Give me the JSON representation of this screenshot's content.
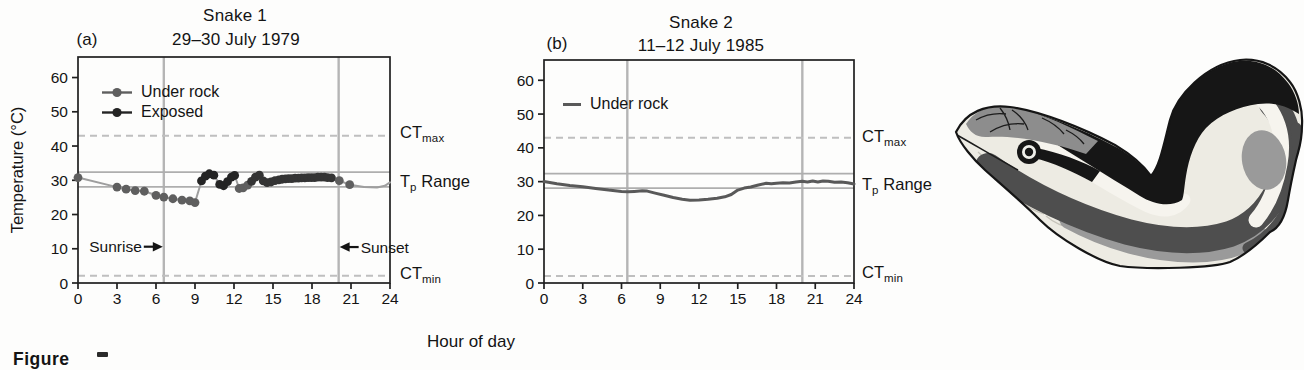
{
  "figure": {
    "panel_a_label": "(a)",
    "panel_b_label": "(b)",
    "y_axis_label": "Temperature (°C)",
    "x_axis_label": "Hour of day",
    "caption_fragment": "Figure",
    "labels": {
      "ct_prefix": "CT",
      "ct_max_sub": "max",
      "ct_min_sub": "min",
      "tp_t": "T",
      "tp_sub": "p",
      "tp_rest": " Range",
      "sunrise": "Sunrise",
      "sunset": "Sunset"
    },
    "legend_a": [
      {
        "label": "Under rock",
        "marker": "dot-line",
        "color_key": "under_rock"
      },
      {
        "label": "Exposed",
        "marker": "dot-line",
        "color_key": "exposed"
      }
    ],
    "legend_b": [
      {
        "label": "Under rock",
        "marker": "line",
        "color_key": "line_b"
      }
    ]
  },
  "colors": {
    "text": "#141414",
    "axis": "#1f1f1f",
    "under_rock": "#5f5f5f",
    "exposed": "#242424",
    "exposed_dark": "#343434",
    "connect_line": "#9e9e9e",
    "line_b": "#595959",
    "band_line": "#aeaeae",
    "dashed_line": "#bfbfbf",
    "event_line": "#b5b5b5"
  },
  "chart_data": [
    {
      "id": "a",
      "type": "scatter",
      "panel": "(a)",
      "title": [
        "Snake 1",
        "29–30 July 1979"
      ],
      "xlabel": "Hour of day",
      "ylabel": "Temperature (°C)",
      "xlim": [
        0,
        24
      ],
      "ylim": [
        0,
        66
      ],
      "x_ticks": [
        0,
        3,
        6,
        9,
        12,
        15,
        18,
        21,
        24
      ],
      "y_ticks": [
        0,
        10,
        20,
        30,
        40,
        50,
        60
      ],
      "ct_max": 43,
      "ct_min": 2.1,
      "tp_range": [
        28.1,
        32.4
      ],
      "sunrise_hour": 6.6,
      "sunset_hour": 20.05,
      "annotations": [
        {
          "label": "Sunrise",
          "x": 6.6,
          "y": 10.6,
          "side": "left"
        },
        {
          "label": "Sunset",
          "x": 20.05,
          "y": 10.5,
          "side": "right"
        }
      ],
      "point_series": [
        "under_rock",
        "exposed",
        "exposed_dark",
        "line_only"
      ],
      "line_points": [
        [
          0,
          30.8,
          0
        ],
        [
          3,
          28.0,
          0
        ],
        [
          3.7,
          27.4,
          0
        ],
        [
          4.4,
          27.0,
          0
        ],
        [
          5.1,
          26.8,
          0
        ],
        [
          6.0,
          25.6,
          0
        ],
        [
          6.6,
          25.1,
          0
        ],
        [
          7.3,
          24.6,
          0
        ],
        [
          8.0,
          24.2,
          0
        ],
        [
          8.6,
          24.0,
          0
        ],
        [
          9.0,
          23.5,
          0
        ],
        [
          9.5,
          29.8,
          1
        ],
        [
          9.8,
          31.2,
          1
        ],
        [
          10.1,
          31.9,
          1
        ],
        [
          10.45,
          31.5,
          1
        ],
        [
          10.9,
          28.8,
          1
        ],
        [
          11.2,
          28.4,
          1
        ],
        [
          11.5,
          29.6,
          1
        ],
        [
          11.8,
          30.9,
          1
        ],
        [
          12.05,
          31.4,
          1
        ],
        [
          12.4,
          27.6,
          0
        ],
        [
          12.7,
          27.8,
          0
        ],
        [
          13.05,
          28.6,
          0
        ],
        [
          13.35,
          29.7,
          2
        ],
        [
          13.65,
          30.9,
          2
        ],
        [
          13.95,
          31.5,
          2
        ],
        [
          14.25,
          29.8,
          2
        ],
        [
          14.55,
          29.3,
          2
        ],
        [
          14.85,
          29.5,
          2
        ],
        [
          15.15,
          29.9,
          2
        ],
        [
          15.45,
          30.1,
          2
        ],
        [
          15.7,
          30.3,
          2
        ],
        [
          15.95,
          30.4,
          2
        ],
        [
          16.2,
          30.5,
          2
        ],
        [
          16.45,
          30.5,
          2
        ],
        [
          16.7,
          30.6,
          2
        ],
        [
          16.95,
          30.6,
          2
        ],
        [
          17.2,
          30.7,
          2
        ],
        [
          17.45,
          30.7,
          2
        ],
        [
          17.7,
          30.8,
          2
        ],
        [
          17.95,
          30.8,
          2
        ],
        [
          18.2,
          30.8,
          2
        ],
        [
          18.45,
          30.9,
          2
        ],
        [
          18.7,
          30.9,
          2
        ],
        [
          18.95,
          30.9,
          2
        ],
        [
          19.2,
          30.8,
          2
        ],
        [
          19.5,
          30.7,
          2
        ],
        [
          20.1,
          29.9,
          0
        ],
        [
          20.9,
          28.7,
          0
        ],
        [
          22.0,
          28.0,
          3
        ],
        [
          23.0,
          27.9,
          3
        ],
        [
          23.6,
          28.4,
          3
        ],
        [
          24,
          29.4,
          3
        ]
      ]
    },
    {
      "id": "b",
      "type": "line",
      "panel": "(b)",
      "title": [
        "Snake 2",
        "11–12 July 1985"
      ],
      "xlabel": "Hour of day",
      "ylabel": "Temperature (°C)",
      "xlim": [
        0,
        24
      ],
      "ylim": [
        0,
        66
      ],
      "x_ticks": [
        0,
        3,
        6,
        9,
        12,
        15,
        18,
        21,
        24
      ],
      "y_ticks": [
        0,
        10,
        20,
        30,
        40,
        50,
        60
      ],
      "ct_max": 43,
      "ct_min": 2.1,
      "tp_range": [
        28.1,
        32.4
      ],
      "sunrise_hour": 6.45,
      "sunset_hour": 20.0,
      "annotations": [],
      "line_points": [
        [
          0,
          30.0
        ],
        [
          1,
          29.4
        ],
        [
          2,
          28.9
        ],
        [
          3,
          28.5
        ],
        [
          4,
          28.0
        ],
        [
          5,
          27.5
        ],
        [
          6,
          27.1
        ],
        [
          6.5,
          27.0
        ],
        [
          7,
          27.1
        ],
        [
          7.6,
          27.3
        ],
        [
          8,
          27.2
        ],
        [
          8.6,
          26.6
        ],
        [
          9.3,
          26.0
        ],
        [
          10,
          25.3
        ],
        [
          10.7,
          24.8
        ],
        [
          11.3,
          24.5
        ],
        [
          12,
          24.6
        ],
        [
          12.7,
          24.8
        ],
        [
          13.4,
          25.1
        ],
        [
          14,
          25.5
        ],
        [
          14.5,
          26.2
        ],
        [
          15,
          27.5
        ],
        [
          15.5,
          28.1
        ],
        [
          16,
          28.4
        ],
        [
          16.6,
          29.0
        ],
        [
          17.2,
          29.5
        ],
        [
          17.6,
          29.4
        ],
        [
          18,
          29.5
        ],
        [
          18.5,
          29.7
        ],
        [
          19,
          29.6
        ],
        [
          19.5,
          29.9
        ],
        [
          20,
          30.1
        ],
        [
          20.4,
          29.9
        ],
        [
          20.8,
          30.2
        ],
        [
          21.2,
          29.9
        ],
        [
          21.6,
          30.2
        ],
        [
          22,
          30.1
        ],
        [
          22.5,
          29.8
        ],
        [
          23,
          29.9
        ],
        [
          23.5,
          29.7
        ],
        [
          24,
          29.3
        ]
      ]
    }
  ],
  "snake": {
    "name": "garter-snake-illustration",
    "palette": {
      "outline": "#151515",
      "black_band": "#161616",
      "white_stripe": "#f6f4ee",
      "dark_band": "#4e4e4e",
      "mid_gray": "#9a9a9a",
      "belly": "#edebe3",
      "scale_line": "#c6c3ba",
      "head_top": "#8d8d8d",
      "head_line": "#1c1c1c",
      "eye_ring": "#efefea"
    }
  }
}
